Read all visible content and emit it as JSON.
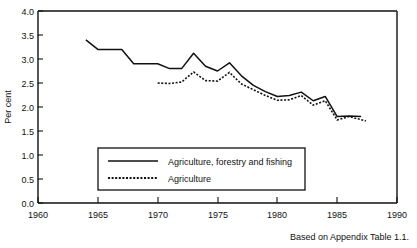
{
  "chart_data": {
    "type": "line",
    "title": "",
    "xlabel": "",
    "ylabel": "Per cent",
    "xlim": [
      1960,
      1990
    ],
    "ylim": [
      0.0,
      4.0
    ],
    "xticks": [
      1960,
      1965,
      1970,
      1975,
      1980,
      1985,
      1990
    ],
    "xtick_labels": [
      "1960",
      "1965",
      "1970",
      "1975",
      "1980",
      "1985",
      "1990"
    ],
    "yticks": [
      0.0,
      0.5,
      1.0,
      1.5,
      2.0,
      2.5,
      3.0,
      3.5,
      4.0
    ],
    "ytick_labels": [
      "0.0",
      "0.5",
      "1.0",
      "1.5",
      "2.0",
      "2.5",
      "3.0",
      "3.5",
      "4.0"
    ],
    "grid": false,
    "legend_position": "lower-left-inside",
    "series": [
      {
        "name": "Agriculture, forestry and fishing",
        "style": "solid",
        "color": "#111111",
        "x": [
          1964,
          1965,
          1966,
          1967,
          1968,
          1969,
          1970,
          1971,
          1972,
          1973,
          1974,
          1975,
          1976,
          1977,
          1978,
          1979,
          1980,
          1981,
          1982,
          1983,
          1984,
          1985,
          1986,
          1987
        ],
        "values": [
          3.4,
          3.2,
          3.2,
          3.2,
          2.9,
          2.9,
          2.9,
          2.8,
          2.8,
          3.12,
          2.85,
          2.75,
          2.92,
          2.65,
          2.45,
          2.32,
          2.22,
          2.24,
          2.31,
          2.13,
          2.22,
          1.8,
          1.81,
          1.8
        ]
      },
      {
        "name": "Agriculture",
        "style": "dotted",
        "color": "#111111",
        "x": [
          1970,
          1971,
          1972,
          1973,
          1974,
          1975,
          1976,
          1977,
          1978,
          1979,
          1980,
          1981,
          1982,
          1983,
          1984,
          1985,
          1986,
          1987.4
        ],
        "values": [
          2.5,
          2.49,
          2.52,
          2.73,
          2.55,
          2.54,
          2.72,
          2.48,
          2.36,
          2.24,
          2.14,
          2.15,
          2.24,
          2.04,
          2.13,
          1.73,
          1.8,
          1.71
        ]
      }
    ]
  },
  "axis": {
    "y_title": "Per cent"
  },
  "legend": {
    "entries": [
      {
        "label": "Agriculture, forestry and fishing",
        "style": "solid"
      },
      {
        "label": "Agriculture",
        "style": "dotted"
      }
    ]
  },
  "footer": {
    "note": "Based on Appendix Table 1.1."
  },
  "cropped_title": {
    "text": ""
  },
  "colors": {
    "line": "#111111",
    "frame": "#111111",
    "background": "#ffffff"
  }
}
